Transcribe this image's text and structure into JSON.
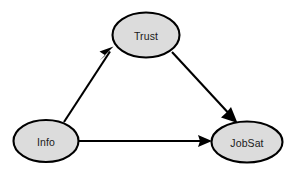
{
  "diagram": {
    "type": "path-model",
    "background_color": "#ffffff",
    "node_fill_color": "#dcdcdc",
    "node_stroke_color": "#000000",
    "edge_color": "#000000",
    "label_color": "#1a1a1a",
    "nodes": [
      {
        "id": "trust",
        "label": "Trust",
        "shape": "ellipse",
        "cx": 146,
        "cy": 35,
        "rx": 33.5,
        "ry": 22.5
      },
      {
        "id": "info",
        "label": "Info",
        "shape": "ellipse",
        "cx": 46,
        "cy": 141,
        "rx": 32.5,
        "ry": 21
      },
      {
        "id": "jobsat",
        "label": "JobSat",
        "shape": "ellipse",
        "cx": 247,
        "cy": 142,
        "rx": 35.5,
        "ry": 20.5
      }
    ],
    "edges": [
      {
        "id": "info-to-trust",
        "from": "Info",
        "to": "Trust",
        "label": "",
        "x1": 64,
        "y1": 122,
        "x2": 113,
        "y2": 48,
        "arrowhead": "filled-triangle"
      },
      {
        "id": "trust-to-jobsat",
        "from": "Trust",
        "to": "JobSat",
        "label": "",
        "x1": 172,
        "y1": 52,
        "x2": 236,
        "y2": 122,
        "arrowhead": "filled-triangle"
      },
      {
        "id": "info-to-jobsat",
        "from": "Info",
        "to": "JobSat",
        "label": "",
        "x1": 79,
        "y1": 141,
        "x2": 211,
        "y2": 141,
        "arrowhead": "filled-triangle"
      }
    ]
  }
}
